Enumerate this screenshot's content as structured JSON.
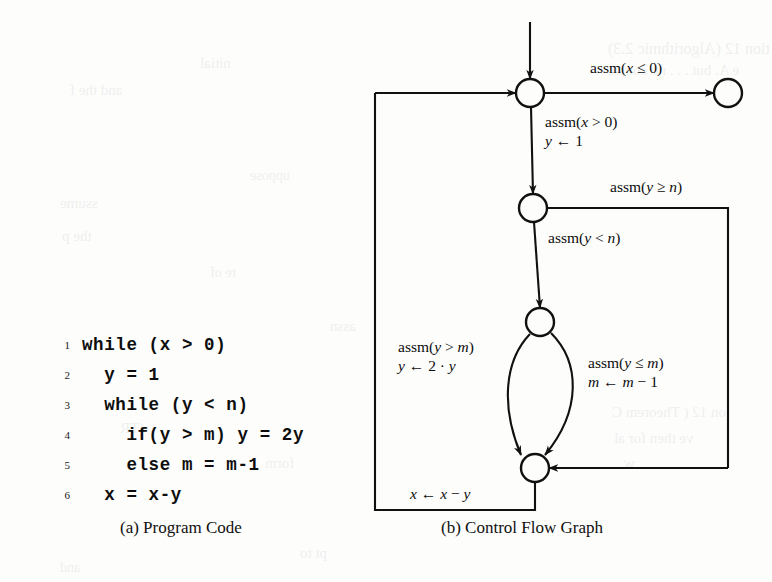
{
  "figure": {
    "caption_a": "(a) Program Code",
    "caption_b": "(b) Control Flow Graph"
  },
  "program_code": {
    "lines": [
      {
        "no": "1",
        "text": "while (x > 0)"
      },
      {
        "no": "2",
        "text": "  y = 1"
      },
      {
        "no": "3",
        "text": "  while (y < n)"
      },
      {
        "no": "4",
        "text": "    if(y > m) y = 2y"
      },
      {
        "no": "5",
        "text": "    else m = m-1"
      },
      {
        "no": "6",
        "text": "  x = x-y"
      }
    ]
  },
  "cfg": {
    "nodes": [
      {
        "id": "n1",
        "name": "loop-head-node",
        "cx": 530,
        "cy": 93,
        "r": 14
      },
      {
        "id": "n2",
        "name": "inner-loop-head-node",
        "cx": 533,
        "cy": 208,
        "r": 14
      },
      {
        "id": "n3",
        "name": "branch-node",
        "cx": 540,
        "cy": 322,
        "r": 14
      },
      {
        "id": "n4",
        "name": "merge-node",
        "cx": 535,
        "cy": 468,
        "r": 14
      },
      {
        "id": "n5",
        "name": "exit-node",
        "cx": 728,
        "cy": 93,
        "r": 14
      }
    ],
    "edge_labels": [
      {
        "id": "e-exit",
        "name": "edge-label-assm-x-le-0",
        "lines": [
          "assm(x ≤ 0)"
        ],
        "x": 590,
        "y": 58
      },
      {
        "id": "e-enter",
        "name": "edge-label-assm-x-gt-0",
        "lines": [
          "assm(x > 0)",
          "y ← 1"
        ],
        "x": 545,
        "y": 112
      },
      {
        "id": "e-yge",
        "name": "edge-label-assm-y-ge-n",
        "lines": [
          "assm(y ≥ n)"
        ],
        "x": 610,
        "y": 177
      },
      {
        "id": "e-ylt",
        "name": "edge-label-assm-y-lt-n",
        "lines": [
          "assm(y < n)"
        ],
        "x": 548,
        "y": 228
      },
      {
        "id": "e-ygt",
        "name": "edge-label-assm-y-gt-m",
        "lines": [
          "assm(y > m)",
          "y ← 2 · y"
        ],
        "x": 398,
        "y": 337
      },
      {
        "id": "e-yle",
        "name": "edge-label-assm-y-le-m",
        "lines": [
          "assm(y ≤ m)",
          "m ← m − 1"
        ],
        "x": 588,
        "y": 353
      },
      {
        "id": "e-backedge",
        "name": "edge-label-x-assign",
        "lines": [
          "x ← x − y"
        ],
        "x": 410,
        "y": 484
      }
    ]
  },
  "ghost_text": [
    {
      "text": "tion 12 (Algorithmic 2.3)",
      "x": 608,
      "y": 40,
      "size": 16
    },
    {
      "text": "e A. but . . . no conjec",
      "x": 608,
      "y": 62,
      "size": 15
    },
    {
      "text": "nitial",
      "x": 200,
      "y": 55,
      "size": 15
    },
    {
      "text": "and the f",
      "x": 70,
      "y": 82,
      "size": 15
    },
    {
      "text": "uppose",
      "x": 250,
      "y": 168,
      "size": 14
    },
    {
      "text": "ssume",
      "x": 60,
      "y": 195,
      "size": 15
    },
    {
      "text": "assn",
      "x": 330,
      "y": 318,
      "size": 15
    },
    {
      "text": "the p",
      "x": 62,
      "y": 228,
      "size": 15
    },
    {
      "text": "re of",
      "x": 210,
      "y": 265,
      "size": 14
    },
    {
      "text": "(TR",
      "x": 120,
      "y": 420,
      "size": 15
    },
    {
      "text": "form",
      "x": 265,
      "y": 455,
      "size": 15
    },
    {
      "text": "on 12 ( Theorem C",
      "x": 612,
      "y": 404,
      "size": 15
    },
    {
      "text": "ve then for al",
      "x": 614,
      "y": 430,
      "size": 15
    },
    {
      "text": "w",
      "x": 624,
      "y": 455,
      "size": 15
    },
    {
      "text": "pt to",
      "x": 300,
      "y": 545,
      "size": 15
    },
    {
      "text": "and",
      "x": 60,
      "y": 560,
      "size": 14
    }
  ]
}
